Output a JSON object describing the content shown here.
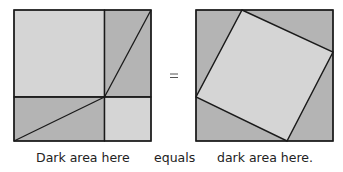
{
  "colors": {
    "light": "#d5d5d5",
    "dark": "#b4b4b4",
    "stroke": "#1a1a1a",
    "background": "#ffffff"
  },
  "left_figure": {
    "description": "Square split into a^2 and b^2 squares plus two rectangles, each rectangle cut by a diagonal",
    "regions": [
      {
        "name": "large-square",
        "shade": "light"
      },
      {
        "name": "small-square",
        "shade": "light"
      },
      {
        "name": "top-right-rectangle",
        "shade": "dark"
      },
      {
        "name": "bottom-left-rectangle",
        "shade": "dark"
      }
    ]
  },
  "equals_symbol": "=",
  "right_figure": {
    "description": "Square with inscribed tilted square (c^2) and four corner right triangles",
    "regions": [
      {
        "name": "inscribed-square",
        "shade": "light"
      },
      {
        "name": "corner-triangles",
        "shade": "dark"
      }
    ]
  },
  "captions": {
    "left": "Dark area here",
    "middle": "equals",
    "right": "dark area here."
  }
}
